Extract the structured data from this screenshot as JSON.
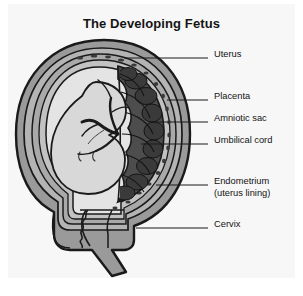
{
  "figure": {
    "title": "The Developing Fetus",
    "background_color": "#f7f7f7",
    "page_color": "#ffffff",
    "ink_color": "#1a1a1a"
  },
  "palette": {
    "uterus_wall": "#9a9a9a",
    "myometrium_mid": "#b0b0b0",
    "endometrium": "#a8a8a8",
    "amniotic_fluid": "#e2e2e2",
    "fetus_body": "#d6d6d6",
    "placenta_dark": "#4a4a4a",
    "outline": "#1a1a1a"
  },
  "labels": [
    {
      "id": "uterus",
      "text": "Uterus",
      "line2": "",
      "text_x": 206,
      "text_y": 21,
      "leader_x1": 116,
      "leader_y1": 24,
      "leader_x2": 200,
      "leader_y2": 24
    },
    {
      "id": "placenta",
      "text": "Placenta",
      "line2": "",
      "text_x": 206,
      "text_y": 63,
      "leader_x1": 159,
      "leader_y1": 66,
      "leader_x2": 200,
      "leader_y2": 66
    },
    {
      "id": "amniotic-sac",
      "text": "Amniotic sac",
      "line2": "",
      "text_x": 206,
      "text_y": 85,
      "leader_x1": 144,
      "leader_y1": 88,
      "leader_x2": 200,
      "leader_y2": 88
    },
    {
      "id": "umbilical-cord",
      "text": "Umbilical cord",
      "line2": "",
      "text_x": 206,
      "text_y": 107,
      "leader_x1": 133,
      "leader_y1": 110,
      "leader_x2": 200,
      "leader_y2": 110
    },
    {
      "id": "endometrium",
      "text": "Endometrium",
      "line2": "(uterus lining)",
      "text_x": 206,
      "text_y": 148,
      "leader_x1": 148,
      "leader_y1": 151,
      "leader_x2": 200,
      "leader_y2": 151
    },
    {
      "id": "cervix",
      "text": "Cervix",
      "line2": "",
      "text_x": 206,
      "text_y": 191,
      "leader_x1": 128,
      "leader_y1": 194,
      "leader_x2": 200,
      "leader_y2": 194
    }
  ]
}
